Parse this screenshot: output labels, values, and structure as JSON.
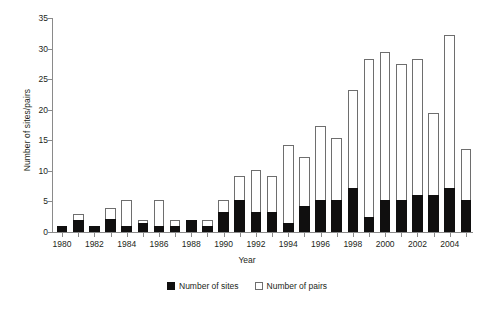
{
  "chart_data": {
    "type": "bar",
    "title": "",
    "subtitle": "",
    "xlabel": "Year",
    "ylabel": "Number of sites/pairs",
    "ylim": [
      0,
      35
    ],
    "ytick_values": [
      0,
      5,
      10,
      15,
      20,
      25,
      30,
      35
    ],
    "ytick_labels": [
      "0",
      "5",
      "10",
      "15",
      "20",
      "25",
      "30",
      "35"
    ],
    "grid": false,
    "stacked": true,
    "legend_position": "bottom-center",
    "categories": [
      "1980",
      "1981",
      "1982",
      "1983",
      "1984",
      "1985",
      "1986",
      "1987",
      "1988",
      "1989",
      "1990",
      "1991",
      "1992",
      "1993",
      "1994",
      "1995",
      "1996",
      "1997",
      "1998",
      "1999",
      "2000",
      "2001",
      "2002",
      "2003",
      "2004",
      "2005"
    ],
    "xtick_labels": [
      "1980",
      "1982",
      "1984",
      "1986",
      "1988",
      "1990",
      "1992",
      "1994",
      "1996",
      "1998",
      "2000",
      "2002",
      "2004"
    ],
    "series": [
      {
        "name": "Number of sites",
        "color": "#100f0f",
        "values": [
          1,
          2,
          1,
          2.2,
          1,
          1.5,
          1,
          1,
          2,
          1,
          3.2,
          5.2,
          3.2,
          3.2,
          1.5,
          4.3,
          5.3,
          5.3,
          7.2,
          2.5,
          5.3,
          5.3,
          6,
          6,
          7.2,
          5.3
        ]
      },
      {
        "name": "Number of pairs",
        "color": "#ffffff",
        "values": [
          1,
          3,
          1,
          4,
          5.2,
          2,
          5.2,
          2,
          2,
          2,
          5.2,
          9.2,
          10.2,
          9.2,
          14.3,
          12.2,
          17.3,
          15.3,
          23.3,
          28.3,
          29.5,
          27.5,
          28.3,
          19.5,
          32.3,
          13.5
        ]
      }
    ],
    "legend": [
      {
        "label": "Number of sites",
        "swatch": "filled-black-square"
      },
      {
        "label": "Number of pairs",
        "swatch": "outlined-white-square"
      }
    ]
  }
}
